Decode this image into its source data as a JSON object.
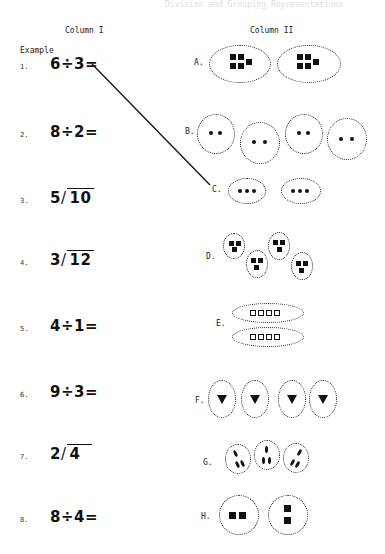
{
  "page": {
    "top_faded_text": "Division and Grouping Representations",
    "column1_header": "Column I",
    "column2_header": "Column II",
    "example_label": "Example"
  },
  "problems": [
    {
      "num": "1.",
      "expr": "6÷3=",
      "type": "inline"
    },
    {
      "num": "2.",
      "expr": "8÷2=",
      "type": "inline"
    },
    {
      "num": "3.",
      "divisor": "5",
      "dividend": "10",
      "type": "long"
    },
    {
      "num": "4.",
      "divisor": "3",
      "dividend": "12",
      "type": "long"
    },
    {
      "num": "5.",
      "expr": "4÷1=",
      "type": "inline"
    },
    {
      "num": "6.",
      "expr": "9÷3=",
      "type": "inline"
    },
    {
      "num": "7.",
      "divisor": "2",
      "dividend": "4",
      "type": "long"
    },
    {
      "num": "8.",
      "expr": "8÷4=",
      "type": "inline"
    }
  ],
  "pictures": [
    {
      "label": "A.",
      "groups": 2,
      "items_per_group": 5,
      "item_shape": "filled-square"
    },
    {
      "label": "B.",
      "groups": 4,
      "items_per_group": 2,
      "item_shape": "dot"
    },
    {
      "label": "C.",
      "groups": 2,
      "items_per_group": 3,
      "item_shape": "dot"
    },
    {
      "label": "D.",
      "groups": 4,
      "items_per_group": 3,
      "item_shape": "filled-square"
    },
    {
      "label": "E.",
      "groups": 2,
      "items_per_group": 4,
      "item_shape": "hollow-square"
    },
    {
      "label": "F.",
      "groups": 4,
      "items_per_group": 1,
      "item_shape": "triangle"
    },
    {
      "label": "G.",
      "groups": 3,
      "items_per_group": 3,
      "item_shape": "ellipse"
    },
    {
      "label": "H.",
      "groups": 2,
      "items_per_group": 2,
      "item_shape": "filled-square"
    }
  ],
  "example_match": {
    "from": "1.",
    "to": "C."
  }
}
